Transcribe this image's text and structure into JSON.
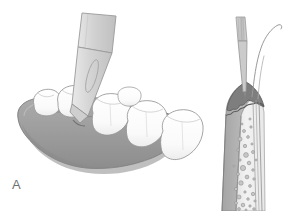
{
  "figure": {
    "domain": "medical-illustration",
    "background_color": "#ffffff",
    "width": 286,
    "height": 211,
    "panel_label": "A"
  },
  "palette": {
    "background": "#ffffff",
    "outline": "#8a8a8a",
    "outline_dark": "#5e5e5e",
    "outline_light": "#b4b4b4",
    "tooth_fill": "#fefefe",
    "tooth_shadow": "#e3e3e3",
    "gingiva_fill": "#9d9d9d",
    "gingiva_shadow": "#8c8c8c",
    "gingiva_highlight": "#b0b0b0",
    "blade_fill": "#d8d8d8",
    "blade_fill_light": "#e8e8e8",
    "handle_fill": "#cfcfcf",
    "epithelium_dark": "#7a7a7a",
    "connective_mid": "#b9b9b9",
    "bone_light": "#efefef",
    "cell_fill": "#c9c9c9",
    "label_color": "#6f6f6f",
    "thread_color": "#9a9a9a"
  },
  "left_panel": {
    "name": "mandible-with-scalpel",
    "elements": {
      "mandible": "mandibular arch with alveolar ridge and gingiva",
      "teeth_count": 6,
      "teeth": [
        {
          "name": "tooth-1",
          "type": "premolar"
        },
        {
          "name": "tooth-2",
          "type": "premolar"
        },
        {
          "name": "tooth-3",
          "type": "molar"
        },
        {
          "name": "tooth-4",
          "type": "molar"
        },
        {
          "name": "tooth-5",
          "type": "molar"
        },
        {
          "name": "tooth-6",
          "type": "molar"
        }
      ],
      "instrument": "scalpel with blade making crestal incision",
      "incision_site": "interdental gingival crest"
    }
  },
  "right_panel": {
    "name": "periodontium-cross-section",
    "elements": {
      "needle": "suture needle holder with striated shaft",
      "thread": "curved suture thread",
      "gingival_epithelium": "dark crestal epithelium band",
      "connective_tissue": "mid-gray connective tissue layer",
      "bone": "light alveolar bone with marrow spaces",
      "root": "tooth root surface with periodontal ligament space",
      "cells_count": 34
    }
  }
}
